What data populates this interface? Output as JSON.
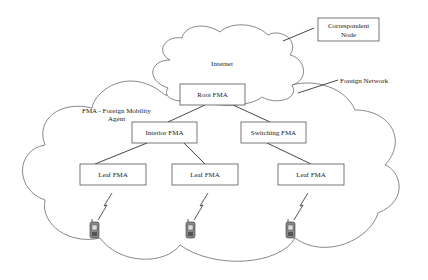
{
  "diagram": {
    "clouds": {
      "internet": {
        "label": "Internet"
      },
      "foreign_network": {
        "label": "Foreign Network"
      }
    },
    "nodes": {
      "correspondent": {
        "line1": "Correspondent",
        "line2": "Node"
      },
      "root": {
        "label": "Root   FMA"
      },
      "interior": {
        "label": "Interior  FMA"
      },
      "switching": {
        "label": "Switching FMA"
      },
      "leaf1": {
        "label": "Leaf  FMA"
      },
      "leaf2": {
        "label": "Leaf  FMA"
      },
      "leaf3": {
        "label": "Leaf  FMA"
      }
    },
    "legend": {
      "line1": "FMA  -  Foreign Mobility",
      "line2": "Agent"
    },
    "edges": [
      [
        "internet",
        "correspondent"
      ],
      [
        "root",
        "interior"
      ],
      [
        "root",
        "switching"
      ],
      [
        "interior",
        "leaf1"
      ],
      [
        "interior",
        "leaf2"
      ],
      [
        "switching",
        "leaf3"
      ]
    ],
    "mobiles": [
      {
        "id": "mobile-1",
        "icon": "mobile-phone-icon",
        "link": "wireless-link-icon"
      },
      {
        "id": "mobile-2",
        "icon": "mobile-phone-icon",
        "link": "wireless-link-icon"
      },
      {
        "id": "mobile-3",
        "icon": "mobile-phone-icon",
        "link": "wireless-link-icon"
      }
    ]
  }
}
